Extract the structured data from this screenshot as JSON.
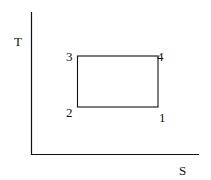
{
  "diagram": {
    "type": "T-S diagram (temperature-entropy)",
    "axes": {
      "y_label": "T",
      "x_label": "S"
    },
    "cycle": {
      "shape": "rectangle",
      "points": [
        {
          "label": "1",
          "position": "bottom-right"
        },
        {
          "label": "2",
          "position": "bottom-left"
        },
        {
          "label": "3",
          "position": "top-left"
        },
        {
          "label": "4",
          "position": "top-right"
        }
      ]
    },
    "colors": {
      "line": "#111111",
      "background": "#ffffff"
    }
  }
}
